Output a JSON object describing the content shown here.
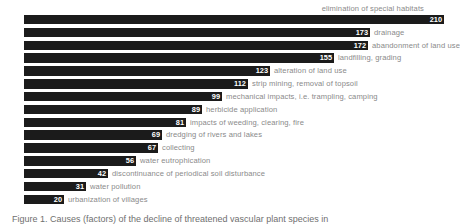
{
  "chart_data": {
    "type": "bar",
    "orientation": "horizontal",
    "title": "",
    "xlabel": "",
    "ylabel": "",
    "xlim": [
      0,
      210
    ],
    "grid": false,
    "legend": null,
    "categories": [
      "elimination of special habitats",
      "drainage",
      "abandonment of land use",
      "landfilling, grading",
      "alteration of land use",
      "strip mining, removal of topsoil",
      "mechanical impacts, i.e. trampling, camping",
      "herbicide application",
      "impacts of weeding, clearing, fire",
      "dredging of rivers and lakes",
      "collecting",
      "water eutrophication",
      "discontinuance of periodical soil disturbance",
      "water pollution",
      "urbanization of villages"
    ],
    "values": [
      210,
      173,
      172,
      155,
      123,
      112,
      99,
      89,
      81,
      69,
      67,
      56,
      42,
      31,
      20
    ],
    "label_position": [
      "above",
      "right",
      "right",
      "right",
      "right",
      "right",
      "right",
      "right",
      "right",
      "right",
      "right",
      "right",
      "right",
      "right",
      "right"
    ],
    "bar_color": "#1b1b1b",
    "value_label_color": "#ffffff",
    "category_label_color": "#8a8a8a"
  },
  "caption": {
    "text": "Figure 1. Causes (factors) of the decline of threatened vascular plant species in"
  }
}
